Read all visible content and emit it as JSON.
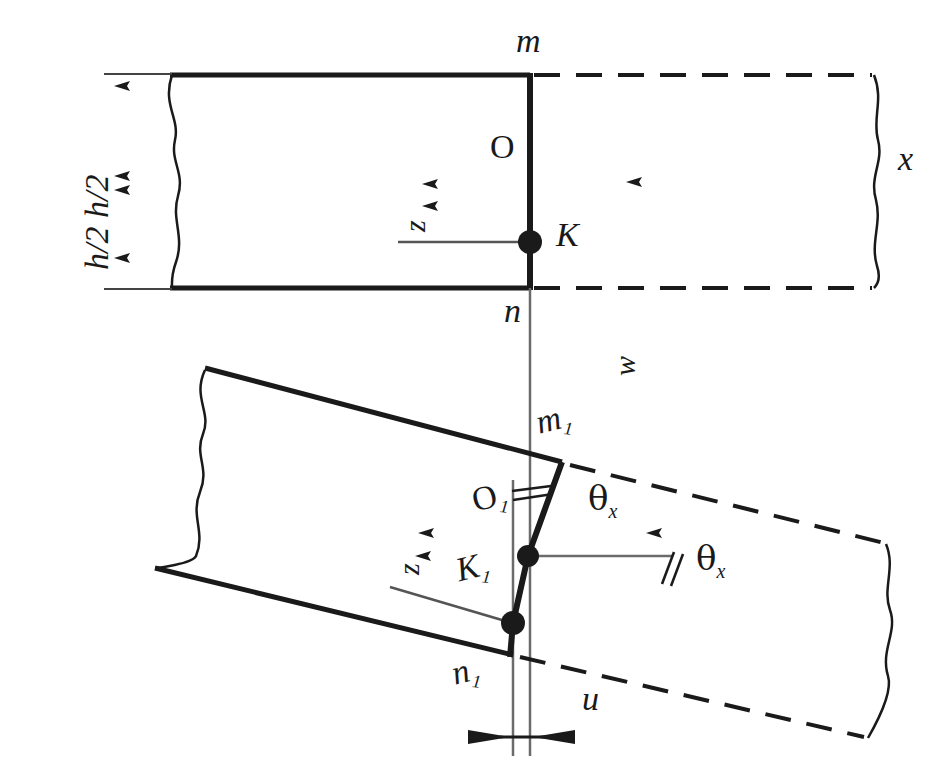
{
  "figure": {
    "background_color": "#ffffff",
    "line_color": "#1a1a1a",
    "width": 952,
    "height": 782
  },
  "labels": {
    "h_half_pair": "h/2 h/2",
    "m": "m",
    "n": "n",
    "O": "O",
    "K": "K",
    "z_top": "z",
    "x": "x",
    "w": "w",
    "m1_base": "m",
    "m1_sub": "1",
    "n1_base": "n",
    "n1_sub": "1",
    "O1_base": "O",
    "O1_sub": "1",
    "K1_base": "K",
    "K1_sub": "1",
    "z_bottom": "z",
    "theta_base": "θ",
    "theta_sub": "x",
    "u": "u"
  },
  "geometry": {
    "top_block": {
      "top_edge_y": 75,
      "bottom_edge_y": 288,
      "left_x": 170,
      "right_solid_x": 530,
      "right_dashed_x": 878,
      "mid_y": 185
    },
    "bottom_block": {
      "corner_top_left": [
        205,
        368
      ],
      "corner_bottom_left": [
        155,
        568
      ],
      "corner_m1": [
        562,
        462
      ],
      "corner_n1": [
        513,
        655
      ],
      "dashed_right_x": 895,
      "rotation_deg": -14
    },
    "points": {
      "K": [
        530,
        242
      ],
      "O": [
        530,
        180
      ],
      "K1": [
        513,
        623
      ],
      "O1": [
        528,
        556
      ]
    },
    "center_line_x": 530,
    "offset_line_x": 513
  },
  "annotations": {
    "angle_mark_count": 2,
    "parallel_mark_count": 2,
    "dimension_arrows": [
      "h/2-upper",
      "h/2-lower",
      "u-horizontal"
    ]
  }
}
